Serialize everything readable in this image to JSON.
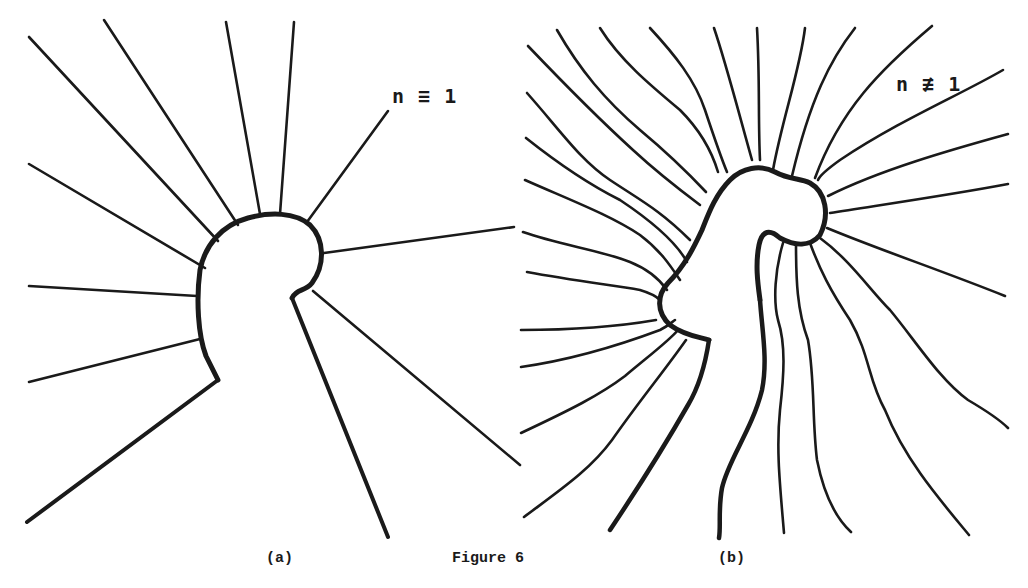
{
  "figure": {
    "caption": "Figure 6",
    "ink_color": "#1a1a1a",
    "background": "#ffffff"
  },
  "panel_a": {
    "subcaption": "(a)",
    "annotation": "n ≡ 1",
    "body_outline": "M 218,380 L 206,356 C 198,335 196,300 200,270 C 205,245 222,225 248,218 C 270,212 295,212 310,225 C 325,240 325,265 312,283 C 305,292 297,288 292,298",
    "lines_thin": [
      "M 29,37 L 218,241",
      "M 104,20 L 238,225",
      "M 226,22 L 260,214",
      "M 294,22 L 280,214",
      "M 388,111 L 307,222",
      "M 29,164 L 205,268",
      "M 29,286 L 197,296",
      "M 29,382 L 200,339",
      "M 324,253 L 514,227",
      "M 313,291 L 520,465"
    ],
    "lines_thick": [
      "M 218,380 L 27,522",
      "M 292,298 L 388,537"
    ]
  },
  "panel_b": {
    "subcaption": "(b)",
    "annotation": "n ≢ 1",
    "body_outline": "M 709,340 C 700,337 685,336 670,325 C 656,312 657,295 668,283 C 685,266 695,245 702,230 C 708,215 715,195 730,180 C 742,168 760,164 775,172 C 790,180 800,178 810,183 C 826,192 830,215 820,235 C 810,247 795,246 780,238 C 770,229 762,230 759,245 C 755,265 758,285 760,300",
    "inner_stem": "M 760,300 C 762,330 768,360 762,390 C 752,430 728,460 722,488 C 718,510 721,527 719,538",
    "left_stem": "M 709,340 C 706,360 700,385 688,405 C 668,440 650,470 610,530",
    "lines": [
      "M 528,46 C 570,90 600,120 633,150 C 660,175 680,190 700,205",
      "M 557,30 C 580,70 605,100 640,130 C 670,155 690,175 706,192",
      "M 600,28 C 620,60 650,85 680,110 C 700,130 712,152 718,172",
      "M 650,28 C 675,55 695,80 705,110 C 715,140 722,160 727,172",
      "M 714,28 C 725,60 738,110 752,160",
      "M 757,28 C 760,80 758,120 760,160",
      "M 805,28 C 800,70 782,120 773,170",
      "M 855,28 C 830,60 810,100 792,176",
      "M 932,26 C 880,70 840,110 815,178",
      "M 1003,70 C 960,95 900,120 840,160 C 826,170 820,175 818,180",
      "M 1008,134 C 950,150 880,170 828,196",
      "M 1008,184 C 950,195 880,205 830,213",
      "M 527,93 C 560,130 580,160 610,180 C 640,200 660,210 690,240",
      "M 526,138 C 560,165 590,185 620,200 C 650,220 675,240 687,262",
      "M 525,180 C 570,200 610,215 640,235 C 660,250 670,265 680,280",
      "M 523,232 C 560,245 600,250 630,262 C 650,270 660,280 667,290",
      "M 527,272 C 570,280 610,285 640,290 C 650,293 655,295 660,300",
      "M 521,330 C 560,330 610,328 656,320",
      "M 521,367 C 570,360 620,345 660,330 C 668,326 672,322 675,320",
      "M 521,433 C 570,410 600,395 625,376 C 650,355 670,340 678,330",
      "M 524,517 C 560,490 590,470 612,440 C 640,400 665,370 686,340",
      "M 783,243 C 775,270 773,300 778,320 C 786,345 784,375 780,410 C 776,450 780,485 784,533",
      "M 796,243 C 796,280 797,310 808,340 C 815,380 812,420 817,460 C 825,500 838,520 851,532",
      "M 810,243 C 820,270 830,290 850,320 C 870,355 868,380 885,410 C 905,460 940,500 969,535",
      "M 820,238 C 850,260 870,290 890,310 C 915,340 940,380 968,400 C 985,410 1000,420 1008,428",
      "M 827,228 C 880,250 940,270 1005,296"
    ]
  }
}
